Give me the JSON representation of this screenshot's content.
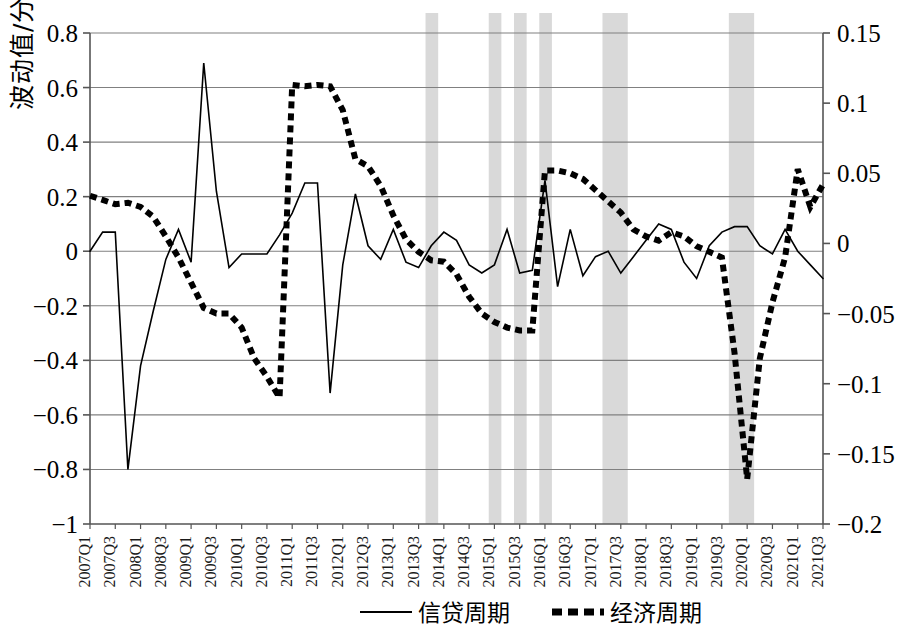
{
  "chart_data": {
    "type": "line",
    "title": "",
    "xlabel": "",
    "ylabel": "波动值/分",
    "ylabel_right": "",
    "ylim": [
      -1,
      0.8
    ],
    "ylim_right": [
      -0.2,
      0.15
    ],
    "grid": true,
    "legend_position": "bottom",
    "x": [
      "2007Q1",
      "2007Q2",
      "2007Q3",
      "2007Q4",
      "2008Q1",
      "2008Q2",
      "2008Q3",
      "2008Q4",
      "2009Q1",
      "2009Q2",
      "2009Q3",
      "2009Q4",
      "2010Q1",
      "2010Q2",
      "2010Q3",
      "2010Q4",
      "2011Q1",
      "2011Q2",
      "2011Q3",
      "2011Q4",
      "2012Q1",
      "2012Q2",
      "2012Q3",
      "2012Q4",
      "2013Q1",
      "2013Q2",
      "2013Q3",
      "2013Q4",
      "2014Q1",
      "2014Q2",
      "2014Q3",
      "2014Q4",
      "2015Q1",
      "2015Q2",
      "2015Q3",
      "2015Q4",
      "2016Q1",
      "2016Q2",
      "2016Q3",
      "2016Q4",
      "2017Q1",
      "2017Q2",
      "2017Q3",
      "2017Q4",
      "2018Q1",
      "2018Q2",
      "2018Q3",
      "2018Q4",
      "2019Q1",
      "2019Q2",
      "2019Q3",
      "2019Q4",
      "2020Q1",
      "2020Q2",
      "2020Q3",
      "2020Q4",
      "2021Q1",
      "2021Q2",
      "2021Q3"
    ],
    "xtick_labels": [
      "2007Q1",
      "2007Q3",
      "2008Q1",
      "2008Q3",
      "2009Q1",
      "2009Q3",
      "2010Q1",
      "2010Q3",
      "2011Q1",
      "2011Q3",
      "2012Q1",
      "2012Q3",
      "2013Q1",
      "2013Q3",
      "2014Q1",
      "2014Q3",
      "2015Q1",
      "2015Q3",
      "2016Q1",
      "2016Q3",
      "2017Q1",
      "2017Q3",
      "2018Q1",
      "2018Q3",
      "2019Q1",
      "2019Q3",
      "2020Q1",
      "2020Q3",
      "2021Q1",
      "2021Q3"
    ],
    "ytick_labels_left": [
      "0.8",
      "0.6",
      "0.4",
      "0.2",
      "0",
      "-0.2",
      "-0.4",
      "-0.6",
      "-0.8",
      "-1"
    ],
    "ytick_values_left": [
      0.8,
      0.6,
      0.4,
      0.2,
      0,
      -0.2,
      -0.4,
      -0.6,
      -0.8,
      -1
    ],
    "ytick_labels_right": [
      "0.15",
      "0.1",
      "0.05",
      "0",
      "-0.05",
      "-0.1",
      "-0.15",
      "-0.2"
    ],
    "ytick_values_right": [
      0.15,
      0.1,
      0.05,
      0,
      -0.05,
      -0.1,
      -0.15,
      -0.2
    ],
    "series": [
      {
        "name": "信贷周期",
        "axis": "left",
        "style": "solid",
        "color": "#000000",
        "values": [
          0.0,
          0.07,
          0.07,
          -0.8,
          -0.42,
          -0.22,
          -0.03,
          0.08,
          -0.04,
          0.69,
          0.22,
          -0.06,
          -0.01,
          -0.01,
          -0.01,
          0.06,
          0.14,
          0.25,
          0.25,
          -0.52,
          -0.05,
          0.21,
          0.02,
          -0.03,
          0.08,
          -0.04,
          -0.06,
          0.02,
          0.07,
          0.04,
          -0.05,
          -0.08,
          -0.05,
          0.08,
          -0.08,
          -0.07,
          0.26,
          -0.13,
          0.08,
          -0.09,
          -0.02,
          0.0,
          -0.08,
          -0.02,
          0.04,
          0.1,
          0.08,
          -0.04,
          -0.1,
          0.02,
          0.07,
          0.09,
          0.09,
          0.02,
          -0.01,
          0.08,
          0.0,
          -0.05,
          -0.1
        ]
      },
      {
        "name": "经济周期",
        "axis": "right",
        "style": "dashed",
        "color": "#000000",
        "values": [
          0.034,
          0.031,
          0.028,
          0.029,
          0.026,
          0.019,
          0.005,
          -0.01,
          -0.028,
          -0.046,
          -0.05,
          -0.05,
          -0.06,
          -0.082,
          -0.095,
          -0.11,
          0.113,
          0.112,
          0.113,
          0.112,
          0.095,
          0.06,
          0.055,
          0.041,
          0.02,
          0.003,
          -0.006,
          -0.012,
          -0.013,
          -0.022,
          -0.038,
          -0.05,
          -0.056,
          -0.06,
          -0.062,
          -0.062,
          0.052,
          0.052,
          0.05,
          0.046,
          0.038,
          0.03,
          0.022,
          0.01,
          0.005,
          0.002,
          0.008,
          0.005,
          -0.002,
          -0.006,
          -0.01,
          -0.078,
          -0.168,
          -0.082,
          -0.042,
          -0.01,
          0.053,
          0.026,
          0.042
        ]
      }
    ],
    "shaded_bands": [
      {
        "start": "2013Q4",
        "end": "2014Q1",
        "color": "#d9d9d9"
      },
      {
        "start": "2015Q1",
        "end": "2015Q2",
        "color": "#d9d9d9"
      },
      {
        "start": "2015Q3",
        "end": "2015Q4",
        "color": "#d9d9d9"
      },
      {
        "start": "2016Q1",
        "end": "2016Q2",
        "color": "#d9d9d9"
      },
      {
        "start": "2017Q2",
        "end": "2017Q4",
        "color": "#d9d9d9"
      },
      {
        "start": "2019Q4",
        "end": "2020Q2",
        "color": "#d9d9d9"
      }
    ],
    "legend": [
      {
        "label": "信贷周期",
        "style": "solid"
      },
      {
        "label": "经济周期",
        "style": "dashed"
      }
    ]
  }
}
